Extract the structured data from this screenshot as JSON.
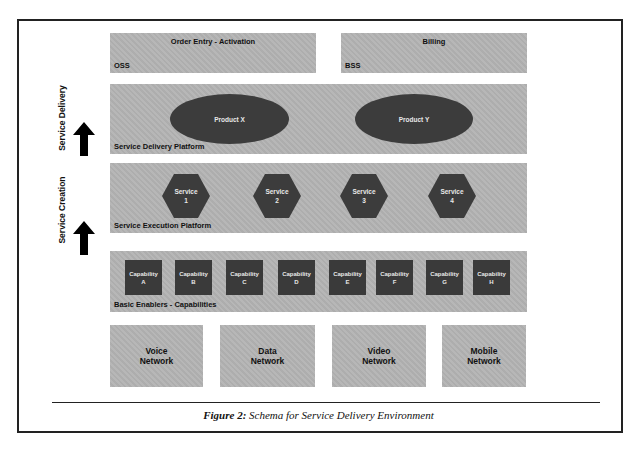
{
  "diagram": {
    "top_row": [
      {
        "title": "Order Entry - Activation",
        "label": "OSS"
      },
      {
        "title": "Billing",
        "label": "BSS"
      }
    ],
    "service_delivery_platform": {
      "label": "Service Delivery Platform",
      "products": [
        "Product X",
        "Product Y"
      ]
    },
    "service_execution_platform": {
      "label": "Service Execution Platform",
      "services": [
        {
          "name": "Service",
          "number": "1"
        },
        {
          "name": "Service",
          "number": "2"
        },
        {
          "name": "Service",
          "number": "3"
        },
        {
          "name": "Service",
          "number": "4"
        }
      ]
    },
    "basic_enablers": {
      "label": "Basic Enablers - Capabilities",
      "capabilities": [
        {
          "name": "Capability",
          "letter": "A"
        },
        {
          "name": "Capability",
          "letter": "B"
        },
        {
          "name": "Capability",
          "letter": "C"
        },
        {
          "name": "Capability",
          "letter": "D"
        },
        {
          "name": "Capability",
          "letter": "E"
        },
        {
          "name": "Capability",
          "letter": "F"
        },
        {
          "name": "Capability",
          "letter": "G"
        },
        {
          "name": "Capability",
          "letter": "H"
        }
      ]
    },
    "networks": [
      {
        "line1": "Voice",
        "line2": "Network"
      },
      {
        "line1": "Data",
        "line2": "Network"
      },
      {
        "line1": "Video",
        "line2": "Network"
      },
      {
        "line1": "Mobile",
        "line2": "Network"
      }
    ],
    "side_labels": {
      "delivery": "Service Delivery",
      "creation": "Service Creation"
    }
  },
  "caption": {
    "prefix": "Figure 2:",
    "text": " Schema for Service Delivery Environment"
  },
  "colors": {
    "layer_fill": "#b3b3b3",
    "shape_fill": "#3c3c3c",
    "shape_text": "#e8e8e8",
    "border": "#222222"
  }
}
